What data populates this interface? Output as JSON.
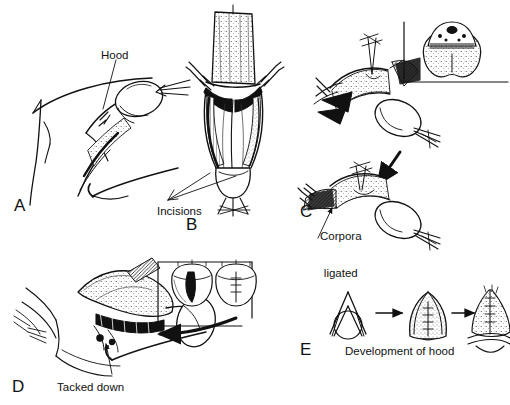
{
  "figure": {
    "background_color": "#ffffff",
    "ink_color": "#111111",
    "width": 510,
    "height": 405,
    "style": "pen-and-ink line drawing with stipple and cross-hatch shading"
  },
  "panels": [
    {
      "letter": "A",
      "letter_x": 14,
      "letter_y": 197,
      "caption": "Hood",
      "caption_x": 101,
      "caption_y": 49,
      "description": "Lateral view of shaft with suprapubic skin outline; hood flap held by forceps, leader line to hood"
    },
    {
      "letter": "B",
      "letter_x": 186,
      "letter_y": 216,
      "caption": "Incisions",
      "caption_x": 157,
      "caption_y": 205,
      "description": "Frontal view with retracted tissue flap above; paired longitudinal incisions marked by two leader lines"
    },
    {
      "letter": "C",
      "letter_x": 300,
      "letter_y": 203,
      "caption_line1": "Corpora",
      "caption_line2": "ligated",
      "caption_x": 320,
      "caption_y": 205,
      "description": "Two sequential oblique views joined by a downward arrow; corpora dissected then ligated"
    },
    {
      "letter": "D",
      "letter_x": 12,
      "letter_y": 378,
      "caption": "Tacked down",
      "caption_x": 57,
      "caption_y": 381,
      "description": "Oblique view of flap tacked down to the shaft base with sutures; boxed inset and curved arrow"
    },
    {
      "letter": "E",
      "letter_x": 300,
      "letter_y": 341,
      "caption": "Development of hood",
      "caption_x": 345,
      "caption_y": 345,
      "description": "Three-stage progression of hood formation separated by arrows"
    }
  ],
  "insets": [
    {
      "name": "cross-section-inset",
      "panel": "C",
      "description": "Transverse cross-section: paired stippled corpora cavernosa below, corpus spongiosum with urethra above"
    },
    {
      "name": "glans-inset",
      "panel": "D",
      "description": "Two glans end-on views: left with open vertical incision, right with closed suture line"
    }
  ],
  "stages_panel_e": [
    {
      "index": 1,
      "description": "Open V flap over circular glans"
    },
    {
      "index": 2,
      "description": "Rounded hood folded with midline sutures"
    },
    {
      "index": 3,
      "description": "Completed hood with closed suture line and shading"
    }
  ]
}
